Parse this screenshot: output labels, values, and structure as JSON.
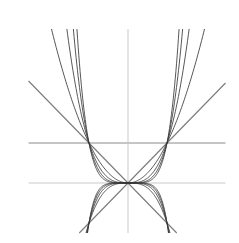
{
  "chart_data": {
    "type": "line",
    "title": "",
    "xlabel": "",
    "ylabel": "",
    "grid": false,
    "legend": null,
    "xlim": [
      -2.55,
      2.5
    ],
    "ylim": [
      -1.25,
      3.85
    ],
    "reference_lines": [
      {
        "name": "x-axis",
        "kind": "horizontal",
        "y": 0,
        "x_range": [
          -2.55,
          2.5
        ],
        "color": "#c9c9c9"
      },
      {
        "name": "y=1",
        "kind": "horizontal",
        "y": 1,
        "x_range": [
          -2.55,
          2.5
        ],
        "color": "#8a8a8a"
      },
      {
        "name": "y-axis",
        "kind": "vertical",
        "x": 0,
        "y_range": [
          -1.25,
          3.85
        ],
        "color": "#c9c9c9"
      },
      {
        "name": "y=x",
        "kind": "line",
        "slope": 1,
        "x_range": [
          -1.25,
          2.5
        ],
        "color": "#7a7a7a"
      },
      {
        "name": "y=-x",
        "kind": "line",
        "slope": -1,
        "x_range": [
          -2.55,
          1.25
        ],
        "color": "#7a7a7a"
      }
    ],
    "series": [
      {
        "name": "y=|x|^2",
        "exponent": 2,
        "sign": 1,
        "color": "#3a3a3a"
      },
      {
        "name": "y=|x|^3",
        "exponent": 3,
        "sign": 1,
        "color": "#3a3a3a"
      },
      {
        "name": "y=|x|^4",
        "exponent": 4,
        "sign": 1,
        "color": "#3a3a3a"
      },
      {
        "name": "y=|x|^5",
        "exponent": 5,
        "sign": 1,
        "color": "#3a3a3a"
      },
      {
        "name": "y=-|x|^3",
        "exponent": 3,
        "sign": -1,
        "color": "#3a3a3a"
      },
      {
        "name": "y=-|x|^4",
        "exponent": 4,
        "sign": -1,
        "color": "#3a3a3a"
      },
      {
        "name": "y=-|x|^5",
        "exponent": 5,
        "sign": -1,
        "color": "#3a3a3a"
      },
      {
        "name": "y=-|x|^6",
        "exponent": 6,
        "sign": -1,
        "color": "#3a3a3a"
      }
    ],
    "key_points": [
      {
        "label": "origin",
        "x": 0,
        "y": 0
      },
      {
        "label": "(-1,1)",
        "x": -1,
        "y": 1
      },
      {
        "label": "(1,1)",
        "x": 1,
        "y": 1
      },
      {
        "label": "(-1,-1)",
        "x": -1,
        "y": -1
      },
      {
        "label": "(1,-1)",
        "x": 1,
        "y": -1
      }
    ]
  }
}
